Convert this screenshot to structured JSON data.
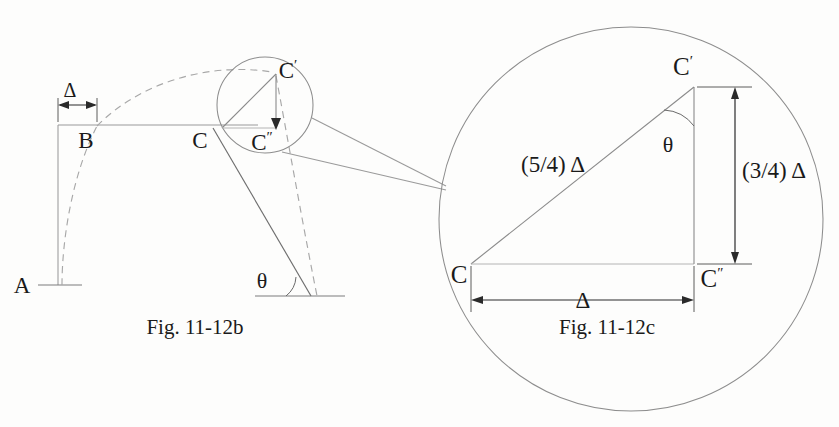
{
  "figure": {
    "domain_note": "engineering-mechanics-deflection-diagram",
    "background_color": "#fdfdfc",
    "ink_color": "#1a1a1a",
    "line_color": "#8d8d8d"
  },
  "fig_b": {
    "caption": "Fig. 11-12b",
    "points": {
      "a": "A",
      "b": "B",
      "c": "C",
      "c_double_prime_base": "C",
      "c_double_prime_mark": "″",
      "c_prime_base": "C",
      "c_prime_mark": "′"
    },
    "dimensions": {
      "delta": "Δ"
    },
    "angles": {
      "theta": "θ"
    }
  },
  "fig_c": {
    "caption": "Fig. 11-12c",
    "points": {
      "c": "C",
      "c_prime_base": "C",
      "c_prime_mark": "′",
      "c_double_prime_base": "C",
      "c_double_prime_mark": "″"
    },
    "dimensions": {
      "hypotenuse": "(5/4) Δ",
      "vertical": "(3/4) Δ",
      "horizontal": "Δ"
    },
    "angles": {
      "theta": "θ"
    }
  }
}
